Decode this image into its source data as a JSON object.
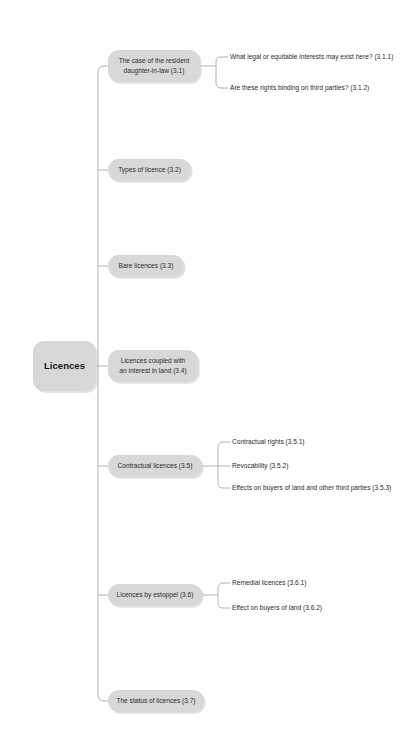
{
  "diagram": {
    "type": "mind-map",
    "title_node": "Licences",
    "root": {
      "label": "Licences",
      "x": 33,
      "y": 341,
      "w": 63,
      "h": 50
    },
    "trunk_x": 98,
    "node_fill": "#d8d8d8",
    "connector_color": "#b4b4b4",
    "text_color": "#2b2b2b",
    "background": "#ffffff",
    "branches": [
      {
        "label": "The case of the resident daughter-in-law (3.1)",
        "lines": [
          "The case of the resident",
          "daughter-in-law (3.1)"
        ],
        "x": 108,
        "y": 50,
        "w": 92,
        "h": 32,
        "stub_y": 66,
        "children": [
          {
            "label": "What legal or equitable interests may exist here? (3.1.1)",
            "y": 57
          },
          {
            "label": "Are these rights binding on third parties? (3.1.2)",
            "y": 88
          }
        ]
      },
      {
        "label": "Types of licence (3.2)",
        "lines": [
          "Types of licence (3.2)"
        ],
        "x": 108,
        "y": 159,
        "w": 83,
        "h": 22,
        "stub_y": 170,
        "children": []
      },
      {
        "label": "Bare licences (3.3)",
        "lines": [
          "Bare licences (3.3)"
        ],
        "x": 108,
        "y": 255,
        "w": 76,
        "h": 22,
        "stub_y": 266,
        "children": []
      },
      {
        "label": "Licences coupled with an interest in land (3.4)",
        "lines": [
          "Licences coupled with",
          "an interest in land (3.4)"
        ],
        "x": 108,
        "y": 350,
        "w": 90,
        "h": 32,
        "stub_y": 366,
        "children": []
      },
      {
        "label": "Contractual licences (3.5)",
        "lines": [
          "Contractual licences (3.5)"
        ],
        "x": 108,
        "y": 455,
        "w": 94,
        "h": 22,
        "stub_y": 466,
        "children": [
          {
            "label": "Contractual rights (3.5.1)",
            "y": 442
          },
          {
            "label": "Revocability (3.5.2)",
            "y": 466
          },
          {
            "label": "Effects on buyers of land and other third parties (3.5.3)",
            "y": 488
          }
        ]
      },
      {
        "label": "Licences by estoppel (3.6)",
        "lines": [
          "Licences by estoppel (3.6)"
        ],
        "x": 108,
        "y": 584,
        "w": 94,
        "h": 22,
        "stub_y": 595,
        "children": [
          {
            "label": "Remedial licences (3.6.1)",
            "y": 583
          },
          {
            "label": "Effect on buyers of land (3.6.2)",
            "y": 608
          }
        ]
      },
      {
        "label": "The status of licences (3.7)",
        "lines": [
          "The status of licences (3.7)"
        ],
        "x": 108,
        "y": 690,
        "w": 96,
        "h": 22,
        "stub_y": 701,
        "children": []
      }
    ]
  }
}
